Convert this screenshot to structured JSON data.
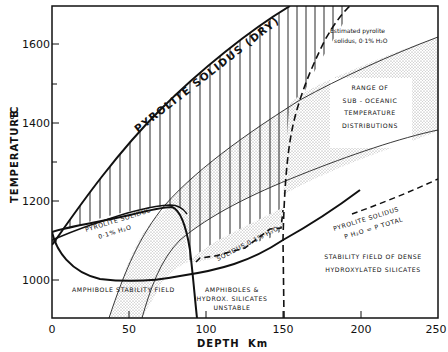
{
  "figure": {
    "x_axis": {
      "title": "DEPTH",
      "unit": "Km",
      "ticks": [
        "0",
        "50",
        "100",
        "150",
        "200",
        "250"
      ]
    },
    "y_axis": {
      "title": "TEMPERATURE",
      "unit": "°C",
      "ticks": [
        "1000",
        "1200",
        "1400",
        "1600"
      ]
    },
    "labels": {
      "dry_solidus": "PYROLITE  SOLIDUS  (DRY)",
      "solidus_01_line1": "PYROLITE  SOLIDUS",
      "solidus_01_line2": "0·1% H₂O",
      "solidus_01_dashed": "SOLIDUS  0·1% H₂O",
      "estimated_line1": "Estimated pyrolite",
      "estimated_line2": "solidus, 0·1% H₂O",
      "range_line1": "RANGE  OF",
      "range_line2": "SUB - OCEANIC",
      "range_line3": "TEMPERATURE",
      "range_line4": "DISTRIBUTIONS",
      "amphibole_field": "AMPHIBOLE  STABILITY  FIELD",
      "unstable_line1": "AMPHIBOLES  &",
      "unstable_line2": "HYDROX.  SILICATES",
      "unstable_line3": "UNSTABLE",
      "ptotal_line1": "PYROLITE   SOLIDUS",
      "ptotal_line2": "P H₂O  =  P TOTAL",
      "dense_line1": "STABILITY  FIELD  OF  DENSE",
      "dense_line2": "HYDROXYLATED  SILICATES"
    },
    "colors": {
      "ink": "#111111",
      "background": "#ffffff",
      "stipple": "#9a9a9a"
    }
  }
}
